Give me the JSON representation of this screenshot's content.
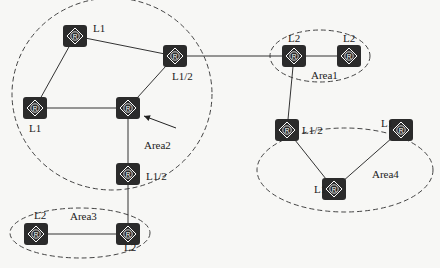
{
  "diagram": {
    "areas": [
      {
        "id": "area1",
        "label": "Area1",
        "cx": 320,
        "cy": 56,
        "rx": 50,
        "ry": 26,
        "lx": 311,
        "ly": 79
      },
      {
        "id": "area2",
        "label": "Area2",
        "cx": 112,
        "cy": 94,
        "rx": 100,
        "ry": 96,
        "lx": 144,
        "ly": 149
      },
      {
        "id": "area3",
        "label": "Area3",
        "cx": 80,
        "cy": 233,
        "rx": 70,
        "ry": 25,
        "lx": 70,
        "ly": 220
      },
      {
        "id": "area4",
        "label": "Area4",
        "cx": 345,
        "cy": 170,
        "rx": 88,
        "ry": 42,
        "lx": 372,
        "ly": 178
      }
    ],
    "routers": [
      {
        "id": "r1",
        "x": 75,
        "y": 36,
        "label": "L1",
        "lx": 93,
        "ly": 32
      },
      {
        "id": "r2",
        "x": 175,
        "y": 56,
        "label": "L1/2",
        "lx": 172,
        "ly": 80
      },
      {
        "id": "r3",
        "x": 35,
        "y": 108,
        "label": "L1",
        "lx": 29,
        "ly": 132
      },
      {
        "id": "r4",
        "x": 128,
        "y": 108,
        "label": "",
        "lx": 0,
        "ly": 0
      },
      {
        "id": "r5",
        "x": 128,
        "y": 174,
        "label": "L1/2",
        "lx": 146,
        "ly": 180
      },
      {
        "id": "r6",
        "x": 36,
        "y": 234,
        "label": "L2",
        "lx": 34,
        "ly": 219
      },
      {
        "id": "r7",
        "x": 128,
        "y": 234,
        "label": "L2",
        "lx": 124,
        "ly": 251
      },
      {
        "id": "r8",
        "x": 294,
        "y": 56,
        "label": "L2",
        "lx": 288,
        "ly": 42
      },
      {
        "id": "r9",
        "x": 349,
        "y": 56,
        "label": "L2",
        "lx": 343,
        "ly": 42
      },
      {
        "id": "r10",
        "x": 287,
        "y": 130,
        "label": "L1/2",
        "lx": 302,
        "ly": 134
      },
      {
        "id": "r11",
        "x": 401,
        "y": 130,
        "label": "L1",
        "lx": 381,
        "ly": 127
      },
      {
        "id": "r12",
        "x": 334,
        "y": 189,
        "label": "L1",
        "lx": 314,
        "ly": 193
      }
    ],
    "links": [
      [
        "r1",
        "r2"
      ],
      [
        "r1",
        "r3"
      ],
      [
        "r3",
        "r4"
      ],
      [
        "r4",
        "r2"
      ],
      [
        "r4",
        "r5"
      ],
      [
        "r5",
        "r7"
      ],
      [
        "r6",
        "r7"
      ],
      [
        "r2",
        "r8"
      ],
      [
        "r8",
        "r9"
      ],
      [
        "r8",
        "r10"
      ],
      [
        "r10",
        "r12"
      ],
      [
        "r11",
        "r12"
      ]
    ],
    "router_glyph": "R",
    "arrow": {
      "x1": 176,
      "y1": 128,
      "x2": 144,
      "y2": 116
    },
    "colors": {
      "router": "#2b2b2b",
      "line": "#333333",
      "dash": "#444444",
      "background": "#f7f7f5"
    }
  }
}
